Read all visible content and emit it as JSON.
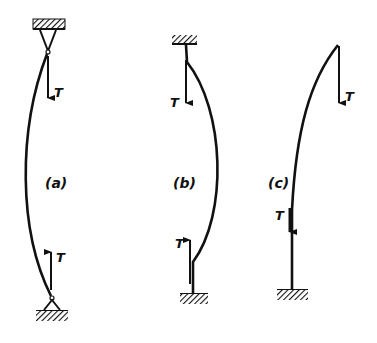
{
  "diagram": {
    "ink_color": "#111111",
    "background": "#ffffff",
    "panels": [
      {
        "id": "a",
        "label": "(a)",
        "force_label_top": "T",
        "force_label_bottom": "T",
        "supports": "pinned-pinned"
      },
      {
        "id": "b",
        "label": "(b)",
        "force_label_top": "T",
        "force_label_bottom": "T",
        "supports": "fixed-fixed"
      },
      {
        "id": "c",
        "label": "(c)",
        "force_label_top": "T",
        "force_label_bottom": "T",
        "supports": "fixed-free"
      }
    ]
  }
}
